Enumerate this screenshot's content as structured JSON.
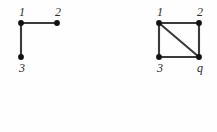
{
  "figure": {
    "background_color": "#fefefe",
    "node_color": "#111111",
    "edge_color": "#3a3a3a",
    "label_color": "#2b2b2b",
    "width": 217,
    "height": 132,
    "graphs": [
      {
        "id": "left-graph",
        "name": "path-graph-p3",
        "nodes": [
          {
            "id": "L1",
            "label": "1",
            "x": 21,
            "y": 23,
            "label_x": 15,
            "label_y": 6,
            "label_position": "above"
          },
          {
            "id": "L2",
            "label": "2",
            "x": 57,
            "y": 23,
            "label_x": 51,
            "label_y": 6,
            "label_position": "above"
          },
          {
            "id": "L3",
            "label": "3",
            "x": 21,
            "y": 57,
            "label_x": 15,
            "label_y": 62,
            "label_position": "below"
          }
        ],
        "edges": [
          {
            "id": "L1-L2",
            "from": "L1",
            "to": "L2",
            "x1": 21,
            "y1": 23,
            "x2": 57,
            "y2": 23
          },
          {
            "id": "L1-L3",
            "from": "L1",
            "to": "L3",
            "x1": 21,
            "y1": 23,
            "x2": 21,
            "y2": 57
          }
        ]
      },
      {
        "id": "right-graph",
        "name": "square-with-diagonal",
        "nodes": [
          {
            "id": "R1",
            "label": "1",
            "x": 159,
            "y": 23,
            "label_x": 153,
            "label_y": 6,
            "label_position": "above"
          },
          {
            "id": "R2",
            "label": "2",
            "x": 199,
            "y": 23,
            "label_x": 193,
            "label_y": 6,
            "label_position": "above"
          },
          {
            "id": "R3",
            "label": "3",
            "x": 159,
            "y": 57,
            "label_x": 153,
            "label_y": 62,
            "label_position": "below"
          },
          {
            "id": "R4",
            "label": "q",
            "x": 199,
            "y": 57,
            "label_x": 193,
            "label_y": 62,
            "label_position": "below"
          }
        ],
        "edges": [
          {
            "id": "R1-R2",
            "from": "R1",
            "to": "R2",
            "x1": 159,
            "y1": 23,
            "x2": 199,
            "y2": 23
          },
          {
            "id": "R1-R3",
            "from": "R1",
            "to": "R3",
            "x1": 159,
            "y1": 23,
            "x2": 159,
            "y2": 57
          },
          {
            "id": "R2-R4",
            "from": "R2",
            "to": "R4",
            "x1": 199,
            "y1": 23,
            "x2": 199,
            "y2": 57
          },
          {
            "id": "R3-R4",
            "from": "R3",
            "to": "R4",
            "x1": 159,
            "y1": 57,
            "x2": 199,
            "y2": 57
          },
          {
            "id": "R1-R4",
            "from": "R1",
            "to": "R4",
            "x1": 159,
            "y1": 23,
            "x2": 199,
            "y2": 57
          }
        ]
      }
    ],
    "node_radius": 2.9
  }
}
